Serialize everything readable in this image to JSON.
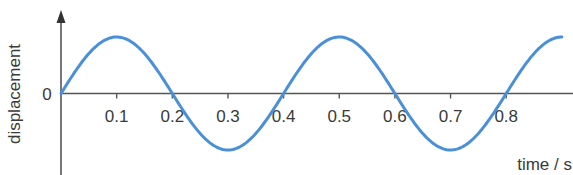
{
  "chart_data": {
    "type": "line",
    "title": "",
    "xlabel": "time / s",
    "ylabel": "displacement",
    "x_tick_labels": [
      "0.1",
      "0.2",
      "0.3",
      "0.4",
      "0.5",
      "0.6",
      "0.7",
      "0.8"
    ],
    "x_ticks": [
      0.1,
      0.2,
      0.3,
      0.4,
      0.5,
      0.6,
      0.7,
      0.8
    ],
    "y_tick_labels": [
      "0"
    ],
    "y_ticks": [
      0
    ],
    "xlim": [
      0,
      0.92
    ],
    "ylim": [
      -1,
      1
    ],
    "grid": false,
    "legend": null,
    "series": [
      {
        "name": "displacement",
        "color": "#4a90d9",
        "function": "sine",
        "amplitude": 1,
        "period": 0.4,
        "x": [
          0,
          0.05,
          0.1,
          0.15,
          0.2,
          0.25,
          0.3,
          0.35,
          0.4,
          0.45,
          0.5,
          0.55,
          0.6,
          0.65,
          0.7,
          0.75,
          0.8,
          0.85,
          0.9
        ],
        "y": [
          0,
          0.71,
          1,
          0.71,
          0,
          -0.71,
          -1,
          -0.71,
          0,
          0.71,
          1,
          0.71,
          0,
          -0.71,
          -1,
          -0.71,
          0,
          0.71,
          1
        ]
      }
    ],
    "colors": {
      "curve": "#4a90d9",
      "axes": "#555555",
      "text": "#3a3a3a"
    }
  },
  "labels": {
    "ylabel": "displacement",
    "xlabel": "time / s",
    "zero": "0"
  }
}
